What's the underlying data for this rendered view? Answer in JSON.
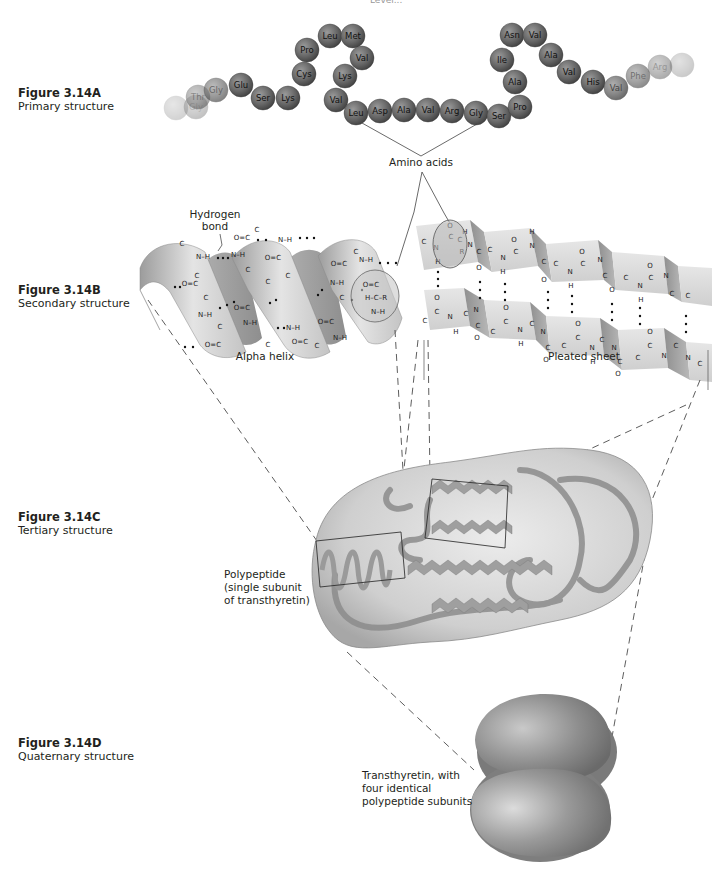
{
  "header": {
    "partial_top_text": "Level..."
  },
  "figures": [
    {
      "number": "Figure 3.14A",
      "description": "Primary structure"
    },
    {
      "number": "Figure 3.14B",
      "description": "Secondary structure"
    },
    {
      "number": "Figure 3.14C",
      "description": "Tertiary structure"
    },
    {
      "number": "Figure 3.14D",
      "description": "Quaternary structure"
    }
  ],
  "primary": {
    "amino_acids": [
      {
        "name": "",
        "x": 176,
        "y": 108,
        "fade": 0.9
      },
      {
        "name": "Gly",
        "x": 196,
        "y": 107,
        "fade": 0.8
      },
      {
        "name": "Thr",
        "x": 198,
        "y": 97,
        "fade": 0.6
      },
      {
        "name": "Gly",
        "x": 216,
        "y": 90,
        "fade": 0.4
      },
      {
        "name": "Glu",
        "x": 241,
        "y": 85,
        "fade": 0
      },
      {
        "name": "Ser",
        "x": 263,
        "y": 98,
        "fade": 0
      },
      {
        "name": "Lys",
        "x": 288,
        "y": 98,
        "fade": 0
      },
      {
        "name": "Cys",
        "x": 304,
        "y": 74,
        "fade": 0
      },
      {
        "name": "Pro",
        "x": 307,
        "y": 50,
        "fade": 0
      },
      {
        "name": "Leu",
        "x": 330,
        "y": 36,
        "fade": 0
      },
      {
        "name": "Met",
        "x": 353,
        "y": 36,
        "fade": 0
      },
      {
        "name": "Val",
        "x": 362,
        "y": 58,
        "fade": 0
      },
      {
        "name": "Lys",
        "x": 345,
        "y": 76,
        "fade": 0
      },
      {
        "name": "Val",
        "x": 336,
        "y": 100,
        "fade": 0
      },
      {
        "name": "Leu",
        "x": 356,
        "y": 113,
        "fade": 0
      },
      {
        "name": "Asp",
        "x": 380,
        "y": 111,
        "fade": 0
      },
      {
        "name": "Ala",
        "x": 404,
        "y": 110,
        "fade": 0
      },
      {
        "name": "Val",
        "x": 428,
        "y": 110,
        "fade": 0
      },
      {
        "name": "Arg",
        "x": 452,
        "y": 111,
        "fade": 0
      },
      {
        "name": "Gly",
        "x": 476,
        "y": 113,
        "fade": 0
      },
      {
        "name": "Ser",
        "x": 499,
        "y": 116,
        "fade": 0
      },
      {
        "name": "Pro",
        "x": 520,
        "y": 107,
        "fade": 0
      },
      {
        "name": "Ala",
        "x": 515,
        "y": 82,
        "fade": 0
      },
      {
        "name": "Ile",
        "x": 502,
        "y": 60,
        "fade": 0
      },
      {
        "name": "Asn",
        "x": 512,
        "y": 35,
        "fade": 0
      },
      {
        "name": "Val",
        "x": 535,
        "y": 35,
        "fade": 0
      },
      {
        "name": "Ala",
        "x": 551,
        "y": 55,
        "fade": 0
      },
      {
        "name": "Val",
        "x": 569,
        "y": 72,
        "fade": 0
      },
      {
        "name": "His",
        "x": 593,
        "y": 82,
        "fade": 0
      },
      {
        "name": "Val",
        "x": 616,
        "y": 88,
        "fade": 0.25
      },
      {
        "name": "Phe",
        "x": 638,
        "y": 76,
        "fade": 0.45
      },
      {
        "name": "Arg",
        "x": 660,
        "y": 67,
        "fade": 0.65
      },
      {
        "name": "",
        "x": 682,
        "y": 65,
        "fade": 0.85
      }
    ],
    "label": "Amino acids"
  },
  "secondary": {
    "hydrogen_bond_label": "Hydrogen\nbond",
    "hydrogen_bond_line1": "Hydrogen",
    "hydrogen_bond_line2": "bond",
    "alpha_helix_label": "Alpha helix",
    "pleated_sheet_label": "Pleated sheet"
  },
  "tertiary": {
    "label_line1": "Polypeptide",
    "label_line2": "(single subunit",
    "label_line3": "of transthyretin)"
  },
  "quaternary": {
    "label_line1": "Transthyretin, with",
    "label_line2": "four  identical",
    "label_line3": "polypeptide subunits"
  },
  "colors": {
    "bead_dark": "#5a5a5a",
    "bead_light": "#9a9a9a",
    "ribbon": "#d0d0d0",
    "ribbon_dark": "#a8a8a8",
    "blob": "#bdbdbd",
    "quaternary": "#8a8a8a"
  }
}
